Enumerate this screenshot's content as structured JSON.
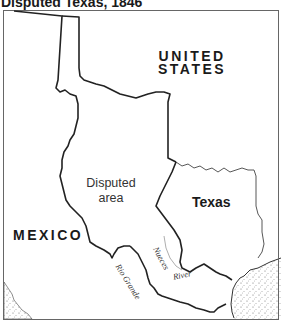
{
  "title": "Disputed Texas, 1846",
  "map": {
    "labels": {
      "united_states_line1": "UNITED",
      "united_states_line2": "STATES",
      "mexico": "MEXICO",
      "texas": "Texas",
      "disputed_line1": "Disputed",
      "disputed_line2": "area",
      "rio_grande": "Rio Grande",
      "nueces": "Nueces",
      "river": "River"
    },
    "colors": {
      "border": "#222222",
      "frame": "#555555",
      "water_stipple": "#555555",
      "background": "#ffffff"
    }
  }
}
